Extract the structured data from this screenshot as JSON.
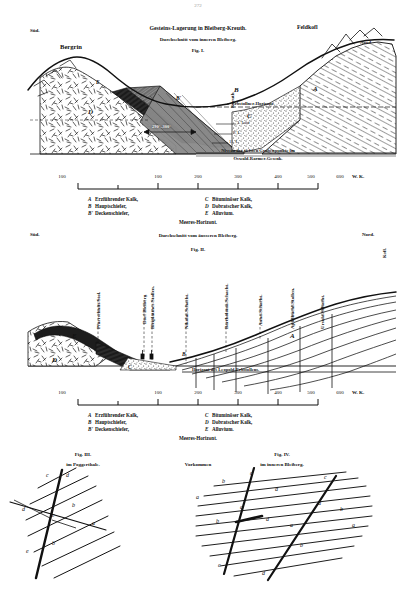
{
  "page": {
    "number": "272"
  },
  "fig1": {
    "title_line1": "Gesteins-Lagerung in Bleiberg-Kreuth.",
    "title_line2": "Durchschnitt vom inneren Bleiberg.",
    "fig_label": "Fig. I.",
    "left_direction": "Süd.",
    "right_direction": "Nord.",
    "peak_left": "Bergrin",
    "peak_right": "Feldkofl",
    "place_kreuth": "Kreuth",
    "dip_annotation": "290°–300°",
    "horizon_upper": "Erbstollner-Horizont.",
    "horizon_lower_line1": "Niveau der tiefsten Grubenpunkte im",
    "horizon_lower_line2": "Oswald-Rarmer-Gesenk.",
    "strata_labels": [
      "E",
      "B'",
      "D",
      "C",
      "B",
      "A"
    ],
    "level_marks": [
      "3. Lauf",
      "9. L.",
      "11. L."
    ],
    "scale": {
      "ticks": [
        "100",
        "100",
        "200",
        "300",
        "400",
        "500",
        "600"
      ],
      "unit": "W. K."
    },
    "legend": {
      "left": [
        {
          "key": "A",
          "name": "Erzführender Kalk,"
        },
        {
          "key": "B",
          "name": "Hauptschiefer,"
        },
        {
          "key": "B'",
          "name": "Deckenschiefer,"
        }
      ],
      "right": [
        {
          "key": "C",
          "name": "Bituminöser Kalk,"
        },
        {
          "key": "D",
          "name": "Dobratscher Kalk,"
        },
        {
          "key": "E",
          "name": "Alluvium."
        }
      ],
      "footer": "Meeres-Horizont."
    }
  },
  "fig2": {
    "title": "Durchschnitt vom äusseren Bleiberg.",
    "fig_label": "Fig. II.",
    "left_direction": "Süd.",
    "right_direction": "Nord.",
    "right_edge_label": "Kofl.",
    "shafts": [
      "Pfarrschnitt-Stol.",
      "Dorf Bleiberg",
      "Bleiplattner-Stollen.",
      "Nikolai-Schacht.",
      "Bartholomä-Schacht.",
      "Anna-Schacht.",
      "Apfelbüchl-Stollen.",
      "Ursula-Schacht."
    ],
    "horizon_label": "Horizont des Leopold-Erbstollens.",
    "strata_labels": [
      "E",
      "D",
      "C",
      "B",
      "A"
    ],
    "scale": {
      "ticks": [
        "100",
        "100",
        "200",
        "300",
        "400",
        "500",
        "600"
      ],
      "unit": "W. K."
    },
    "legend": {
      "left": [
        {
          "key": "A",
          "name": "Erzführender Kalk,"
        },
        {
          "key": "B",
          "name": "Hauptschiefer,"
        },
        {
          "key": "B'",
          "name": "Deckenschiefer,"
        }
      ],
      "right": [
        {
          "key": "C",
          "name": "Bituminöser Kalk,"
        },
        {
          "key": "D",
          "name": "Dobratscher Kalk,"
        },
        {
          "key": "E",
          "name": "Alluvium."
        }
      ],
      "footer": "Meeres-Horizont."
    }
  },
  "bottom": {
    "center_caption": "Vorkommen",
    "fig3": {
      "fig_label": "Fig. III.",
      "subtitle": "im Poggerthale.",
      "letters": [
        "a",
        "b",
        "c",
        "d",
        "e",
        "b",
        "c",
        "a"
      ]
    },
    "fig4": {
      "fig_label": "Fig. IV.",
      "subtitle": "im inneren Bleiberg.",
      "letters": [
        "a",
        "b",
        "c",
        "d",
        "a",
        "b",
        "c",
        "d",
        "b",
        "a"
      ]
    }
  }
}
